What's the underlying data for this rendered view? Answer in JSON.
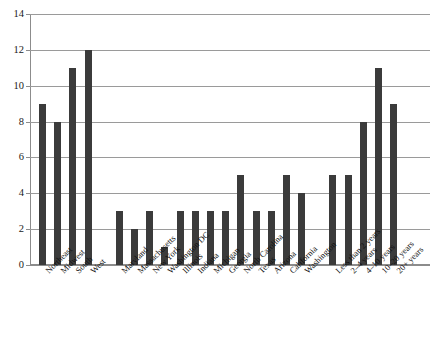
{
  "chart_data": {
    "type": "bar",
    "title": "",
    "subtitle": "",
    "xlabel": "",
    "ylabel": "",
    "ylim": [
      0,
      14
    ],
    "ytick_step": 2,
    "yticks": [
      0,
      2,
      4,
      6,
      8,
      10,
      12,
      14
    ],
    "ytick_labels": [
      "0",
      "2",
      "4",
      "6",
      "8",
      "10",
      "12",
      "14"
    ],
    "grid": true,
    "grid_axis": "y",
    "legend": false,
    "legend_position": "none",
    "bar_color": "#3b3b3b",
    "grid_color": "#9a9a9a",
    "axis_color": "#8c8c8c",
    "categories": [
      "Northeast",
      "Midwest",
      "South",
      "West",
      "Maryland",
      "Massachusetts",
      "New York",
      "Washington DC",
      "Illinois",
      "Indiana",
      "Michigan",
      "Georgia",
      "North Carolina",
      "Texas",
      "Arizona",
      "California",
      "Washington",
      "Less than 2 years",
      "2–4 years",
      "4–10 years",
      "10–20 years",
      "20+ years"
    ],
    "values": [
      9,
      8,
      11,
      12,
      3,
      2,
      3,
      1,
      3,
      3,
      3,
      3,
      5,
      3,
      3,
      5,
      4,
      5,
      5,
      8,
      11,
      9
    ],
    "groups": [
      {
        "name": "Region",
        "start_index": 0,
        "count": 4
      },
      {
        "name": "State",
        "start_index": 4,
        "count": 13
      },
      {
        "name": "Tenure",
        "start_index": 17,
        "count": 5
      }
    ]
  }
}
